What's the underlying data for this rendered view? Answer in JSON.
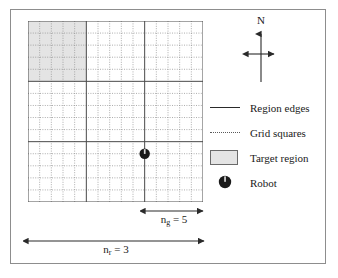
{
  "figure": {
    "type": "grid-map-diagram",
    "background_color": "#ffffff",
    "frame_color": "#8d8d8d"
  },
  "map": {
    "regions_per_side": 3,
    "grid_squares_per_region": 5,
    "total_grid_squares_per_side": 15,
    "region_edge_color": "#4a4a4a",
    "grid_line_color": "#8a8a8a",
    "target_region_fill": "#e4e4e4",
    "target_region": {
      "row": 0,
      "col": 0,
      "description": "top-left region"
    },
    "robot": {
      "grid_col": 10,
      "grid_row": 11,
      "body_color": "#1a1a1a",
      "heading_mark_color": "#d8d8d8"
    }
  },
  "compass": {
    "north_label": "N",
    "arrow_color": "#2a2a2a"
  },
  "legend": {
    "items": [
      {
        "key": "solid-line",
        "icon_name": "solid-line-icon",
        "label": "Region edges"
      },
      {
        "key": "dotted-line",
        "icon_name": "dotted-line-icon",
        "label": "Grid squares"
      },
      {
        "key": "swatch",
        "icon_name": "shaded-rectangle-icon",
        "label": "Target region"
      },
      {
        "key": "robot",
        "icon_name": "robot-marker-icon",
        "label": "Robot"
      }
    ]
  },
  "dimensions": [
    {
      "id": "n_g",
      "symbol": "n",
      "subscript": "g",
      "equals": "=",
      "value": "5",
      "full_label": "n_g = 5",
      "spans": "one region (5 grid squares)"
    },
    {
      "id": "n_r",
      "symbol": "n",
      "subscript": "r",
      "equals": "=",
      "value": "3",
      "full_label": "n_r = 3",
      "spans": "full map (3 regions)"
    }
  ],
  "chart_data": {
    "type": "heatmap",
    "title": "",
    "xlabel": "",
    "ylabel": "",
    "grid": true,
    "legend_position": "right",
    "categories": [
      "region-col-1",
      "region-col-2",
      "region-col-3"
    ],
    "rows": [
      "region-row-1",
      "region-row-2",
      "region-row-3"
    ],
    "values": [
      [
        1,
        0,
        0
      ],
      [
        0,
        0,
        0
      ],
      [
        0,
        0,
        0
      ]
    ],
    "annotations": [
      {
        "text": "N",
        "at": "compass"
      },
      {
        "text": "n_g = 5",
        "at": "bottom-right-region"
      },
      {
        "text": "n_r = 3",
        "at": "bottom-full-width"
      },
      {
        "text": "Robot",
        "at": "legend"
      },
      {
        "text": "Target region",
        "at": "legend"
      },
      {
        "text": "Grid squares",
        "at": "legend"
      },
      {
        "text": "Region edges",
        "at": "legend"
      }
    ]
  }
}
